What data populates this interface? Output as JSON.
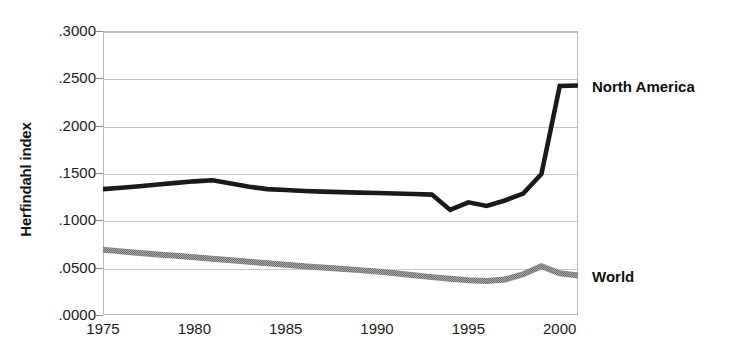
{
  "chart_data": {
    "type": "line",
    "title": "",
    "xlabel": "",
    "ylabel": "Herfindahl index",
    "xlim": [
      1975,
      2001
    ],
    "ylim": [
      0.0,
      0.3
    ],
    "grid": true,
    "legend_position": "right-of-plot (direct series labels)",
    "x": [
      1975,
      1976,
      1977,
      1978,
      1979,
      1980,
      1981,
      1982,
      1983,
      1984,
      1985,
      1986,
      1987,
      1988,
      1989,
      1990,
      1991,
      1992,
      1993,
      1994,
      1995,
      1996,
      1997,
      1998,
      1999,
      2000,
      2001
    ],
    "xticks": [
      "1975",
      "1980",
      "1985",
      "1990",
      "1995",
      "2000"
    ],
    "xtick_values": [
      1975,
      1980,
      1985,
      1990,
      1995,
      2000
    ],
    "yticks": [
      ".0000",
      ".0500",
      ".1000",
      ".1500",
      ".2000",
      ".2500",
      ".3000"
    ],
    "ytick_values": [
      0.0,
      0.05,
      0.1,
      0.15,
      0.2,
      0.25,
      0.3
    ],
    "series": [
      {
        "name": "North America",
        "color": "#1a1a1a",
        "style": "solid-thick",
        "values": [
          0.133,
          0.1345,
          0.136,
          0.1378,
          0.1396,
          0.1412,
          0.1423,
          0.139,
          0.1355,
          0.133,
          0.132,
          0.131,
          0.1303,
          0.1298,
          0.1293,
          0.1288,
          0.1283,
          0.1278,
          0.1272,
          0.111,
          0.119,
          0.1152,
          0.121,
          0.1283,
          0.149,
          0.242,
          0.2425
        ]
      },
      {
        "name": "World",
        "color": "#8f8f8f",
        "style": "solid-thick-halftone",
        "values": [
          0.069,
          0.0672,
          0.0655,
          0.064,
          0.0625,
          0.061,
          0.0594,
          0.0578,
          0.0562,
          0.0546,
          0.053,
          0.0516,
          0.0502,
          0.0488,
          0.0474,
          0.046,
          0.044,
          0.042,
          0.04,
          0.0382,
          0.0368,
          0.036,
          0.0375,
          0.043,
          0.0515,
          0.044,
          0.0418
        ]
      }
    ]
  },
  "labels": {
    "north_america": "North America",
    "world": "World"
  },
  "axis": {
    "y_title": "Herfindahl index"
  }
}
